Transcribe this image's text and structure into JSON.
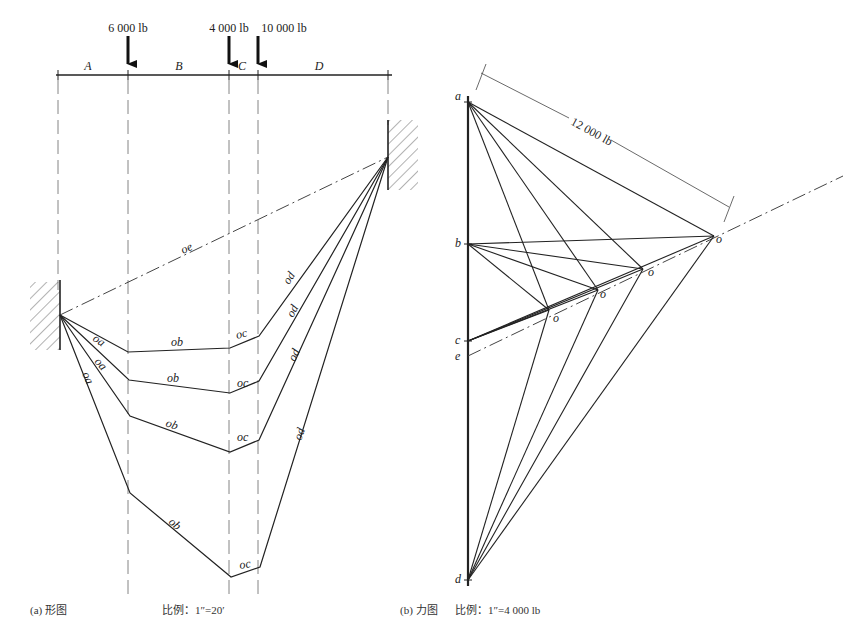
{
  "form_diagram": {
    "loads": [
      {
        "label": "6 000 lb",
        "x": 128
      },
      {
        "label": "4 000 lb",
        "x": 229
      },
      {
        "label": "10 000 lb",
        "x": 258
      }
    ],
    "spaces": [
      "A",
      "B",
      "C",
      "D"
    ],
    "closing_line_label": "oe",
    "segment_labels": {
      "a": "oa",
      "b": "ob",
      "c": "oc",
      "d": "od"
    },
    "caption": "(a) 形图",
    "scale": "比例：1″=20′"
  },
  "force_diagram": {
    "points": {
      "a": "a",
      "b": "b",
      "c": "c",
      "e": "e",
      "d": "d"
    },
    "pole_label": "o",
    "dimension_label": "12 000 lb",
    "caption": "(b) 力图",
    "scale": "比例：1″=4 000 lb"
  },
  "colors": {
    "line": "#222222",
    "dash": "#555555",
    "hatch": "#666666"
  }
}
